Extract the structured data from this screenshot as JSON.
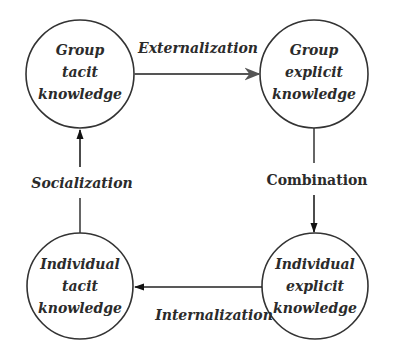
{
  "diagram": {
    "type": "cycle",
    "nodes": [
      {
        "id": "group_tacit",
        "lines": [
          "Group",
          "tacit",
          "knowledge"
        ]
      },
      {
        "id": "group_explicit",
        "lines": [
          "Group",
          "explicit",
          "knowledge"
        ]
      },
      {
        "id": "individual_explicit",
        "lines": [
          "Individual",
          "explicit",
          "knowledge"
        ]
      },
      {
        "id": "individual_tacit",
        "lines": [
          "Individual",
          "tacit",
          "knowledge"
        ]
      }
    ],
    "edges": [
      {
        "from": "group_tacit",
        "to": "group_explicit",
        "label": "Externalization"
      },
      {
        "from": "group_explicit",
        "to": "individual_explicit",
        "label": "Combination"
      },
      {
        "from": "individual_explicit",
        "to": "individual_tacit",
        "label": "Internalization"
      },
      {
        "from": "individual_tacit",
        "to": "group_tacit",
        "label": "Socialization"
      }
    ],
    "colors": {
      "stroke": "#333333",
      "top_arrow": "#555555",
      "text": "#2b2b2b",
      "background": "#ffffff"
    }
  }
}
